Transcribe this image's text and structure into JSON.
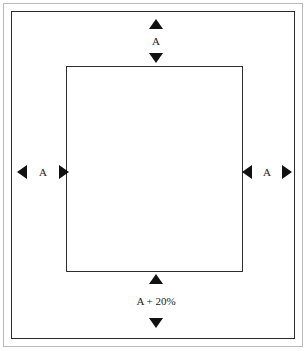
{
  "diagram": {
    "type": "page-margin-dimension-diagram",
    "canvas": {
      "width": 307,
      "height": 351,
      "background": "#ffffff"
    },
    "colors": {
      "outer_frame": "#b9b9b9",
      "page_frame": "#2b2b2b",
      "content_rect": "#2e2e2e",
      "arrow": "#111111",
      "label_text": "#1a1a1a"
    },
    "dimensions": {
      "top": {
        "label": "A",
        "arrow_start": "triangle-up",
        "arrow_end": "triangle-down"
      },
      "left": {
        "label": "A",
        "arrow_start": "triangle-left",
        "arrow_end": "triangle-right"
      },
      "right": {
        "label": "A",
        "arrow_start": "triangle-left",
        "arrow_end": "triangle-right"
      },
      "bottom": {
        "label": "A + 20%",
        "arrow_start": "triangle-up",
        "arrow_end": "triangle-down"
      }
    }
  }
}
